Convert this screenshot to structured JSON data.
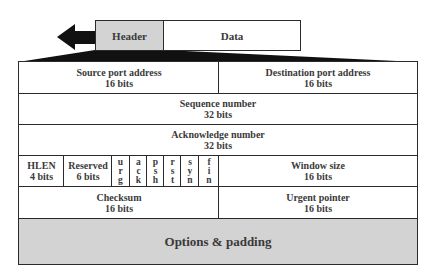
{
  "segment": {
    "header_label": "Header",
    "data_label": "Data",
    "arrow_direction": "left"
  },
  "colors": {
    "header_fill": "#d3d3d3",
    "options_fill": "#d3d3d3",
    "border": "#2a2a2a",
    "text": "#3a3a3a"
  },
  "tcp_header": {
    "rows": [
      {
        "cells": [
          {
            "name": "Source port address",
            "bits": "16 bits"
          },
          {
            "name": "Destination port address",
            "bits": "16 bits"
          }
        ]
      },
      {
        "cells": [
          {
            "name": "Sequence number",
            "bits": "32 bits"
          }
        ]
      },
      {
        "cells": [
          {
            "name": "Acknowledge number",
            "bits": "32 bits"
          }
        ]
      },
      {
        "cells": [
          {
            "name": "HLEN",
            "bits": "4 bits"
          },
          {
            "name": "Reserved",
            "bits": "6 bits"
          },
          {
            "flag": "urg"
          },
          {
            "flag": "ack"
          },
          {
            "flag": "psh"
          },
          {
            "flag": "rst"
          },
          {
            "flag": "syn"
          },
          {
            "flag": "fin"
          },
          {
            "name": "Window size",
            "bits": "16 bits"
          }
        ]
      },
      {
        "cells": [
          {
            "name": "Checksum",
            "bits": "16 bits"
          },
          {
            "name": "Urgent pointer",
            "bits": "16 bits"
          }
        ]
      },
      {
        "cells": [
          {
            "name": "Options & padding"
          }
        ]
      }
    ],
    "flags": [
      "u\nr\ng",
      "a\nc\nk",
      "p\ns\nh",
      "r\ns\nt",
      "s\ny\nn",
      "f\ni\nn"
    ]
  }
}
